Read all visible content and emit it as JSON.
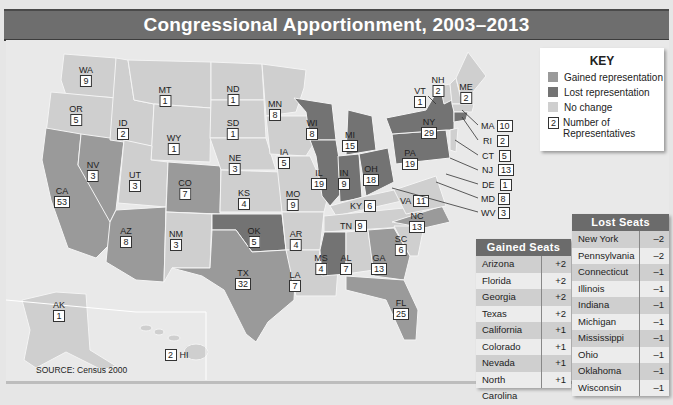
{
  "title": "Congressional Apportionment, 2003–2013",
  "key": {
    "heading": "KEY",
    "items": [
      {
        "label": "Gained representation",
        "color": "#9a9a9a"
      },
      {
        "label": "Lost representation",
        "color": "#737373"
      },
      {
        "label": "No change",
        "color": "#cfcfcf"
      },
      {
        "label": "Number of Representatives",
        "sample": "2"
      }
    ]
  },
  "states": {
    "WA": "9",
    "OR": "5",
    "CA": "53",
    "NV": "3",
    "ID": "2",
    "MT": "1",
    "WY": "1",
    "UT": "3",
    "AZ": "8",
    "CO": "7",
    "NM": "3",
    "ND": "1",
    "SD": "1",
    "NE": "3",
    "KS": "4",
    "OK": "5",
    "TX": "32",
    "MN": "8",
    "IA": "5",
    "MO": "9",
    "AR": "4",
    "LA": "7",
    "WI": "8",
    "IL": "19",
    "MI": "15",
    "IN": "9",
    "OH": "18",
    "KY": "6",
    "TN": "9",
    "MS": "4",
    "AL": "7",
    "GA": "13",
    "FL": "25",
    "SC": "6",
    "NC": "13",
    "VA": "11",
    "WV": "3",
    "MD": "8",
    "DE": "1",
    "NJ": "13",
    "CT": "5",
    "RI": "2",
    "MA": "10",
    "NY": "29",
    "PA": "19",
    "VT": "1",
    "NH": "2",
    "ME": "2",
    "AK": "1",
    "HI": "2"
  },
  "gained_seats": {
    "heading": "Gained Seats",
    "rows": [
      {
        "state": "Arizona",
        "change": "+2"
      },
      {
        "state": "Florida",
        "change": "+2"
      },
      {
        "state": "Georgia",
        "change": "+2"
      },
      {
        "state": "Texas",
        "change": "+2"
      },
      {
        "state": "California",
        "change": "+1"
      },
      {
        "state": "Colorado",
        "change": "+1"
      },
      {
        "state": "Nevada",
        "change": "+1"
      },
      {
        "state": "North Carolina",
        "change": "+1"
      }
    ]
  },
  "lost_seats": {
    "heading": "Lost Seats",
    "rows": [
      {
        "state": "New York",
        "change": "–2"
      },
      {
        "state": "Pennsylvania",
        "change": "–2"
      },
      {
        "state": "Connecticut",
        "change": "–1"
      },
      {
        "state": "Illinois",
        "change": "–1"
      },
      {
        "state": "Indiana",
        "change": "–1"
      },
      {
        "state": "Michigan",
        "change": "–1"
      },
      {
        "state": "Mississippi",
        "change": "–1"
      },
      {
        "state": "Ohio",
        "change": "–1"
      },
      {
        "state": "Oklahoma",
        "change": "–1"
      },
      {
        "state": "Wisconsin",
        "change": "–1"
      }
    ]
  },
  "source": "SOURCE: Census 2000"
}
